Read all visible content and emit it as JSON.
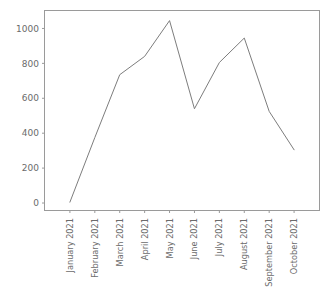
{
  "chart_data": {
    "type": "line",
    "title": "",
    "subtitle": "",
    "xlabel": "",
    "ylabel": "",
    "categories": [
      "January 2021",
      "February 2021",
      "March 2021",
      "April 2021",
      "May 2021",
      "June 2021",
      "July 2021",
      "August 2021",
      "September 2021",
      "October 2021"
    ],
    "values": [
      5,
      375,
      735,
      840,
      1045,
      540,
      805,
      945,
      525,
      305
    ],
    "series": [
      {
        "name": "series-1",
        "values": [
          5,
          375,
          735,
          840,
          1045,
          540,
          805,
          945,
          525,
          305
        ]
      }
    ],
    "ylim": [
      -40,
      1100
    ],
    "xlim": [
      0,
      11
    ],
    "y_ticks": [
      0,
      200,
      400,
      600,
      800,
      1000
    ],
    "y_tick_labels": [
      "0",
      "200",
      "400",
      "600",
      "800",
      "1000"
    ],
    "x_tick_labels": [
      "January 2021",
      "February 2021",
      "March 2021",
      "April 2021",
      "May 2021",
      "June 2021",
      "July 2021",
      "August 2021",
      "September 2021",
      "October 2021"
    ],
    "grid": false,
    "legend": null,
    "legend_position": "none",
    "line_color": "#7d7d7d",
    "axis_color": "#9a9a9a",
    "background_color": "#ffffff",
    "x_tick_label_rotation": -90,
    "markers": false,
    "annotations": []
  }
}
